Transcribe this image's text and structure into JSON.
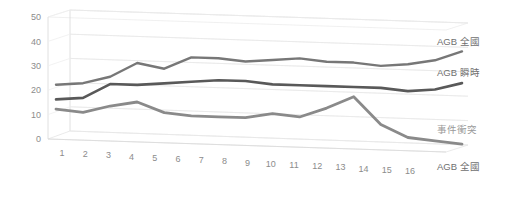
{
  "chart": {
    "type": "line",
    "style": "3d-perspective",
    "title": "",
    "background": "#ffffff"
  },
  "axes": {
    "y": {
      "ticks": [
        "0",
        "10",
        "20",
        "30",
        "40",
        "50"
      ],
      "min": 0,
      "max": 50,
      "label": ""
    },
    "x": {
      "ticks": [
        "1",
        "2",
        "3",
        "4",
        "5",
        "6",
        "7",
        "8",
        "9",
        "10",
        "11",
        "12",
        "13",
        "14",
        "15",
        "16"
      ],
      "label": ""
    },
    "depth": {
      "label": "AGB 全國"
    }
  },
  "legend": {
    "position": "right",
    "items": [
      {
        "label": "AGB 全國",
        "color": "#777777"
      },
      {
        "label": "AGB 瞬時",
        "color": "#595959"
      },
      {
        "label": "事件衝突",
        "color": "#8a8a8a"
      },
      {
        "label": "AGB 全國",
        "color": "#b8b8b8"
      }
    ]
  },
  "chart_data": {
    "type": "line",
    "title": "",
    "xlabel": "",
    "ylabel": "",
    "ylim": [
      0,
      50
    ],
    "grid": true,
    "legend_position": "right",
    "categories": [
      "1",
      "2",
      "3",
      "4",
      "5",
      "6",
      "7",
      "8",
      "9",
      "10",
      "11",
      "12",
      "13",
      "14",
      "15",
      "16"
    ],
    "series": [
      {
        "name": "AGB 全國",
        "color": "#777777",
        "values": [
          21,
          22,
          25,
          31,
          29,
          34,
          34,
          33,
          34,
          35,
          34,
          34,
          33,
          34,
          36,
          40
        ]
      },
      {
        "name": "AGB 瞬時",
        "color": "#595959",
        "values": [
          15,
          16,
          22,
          22,
          23,
          24,
          25,
          25,
          24,
          24,
          24,
          24,
          24,
          23,
          24,
          27
        ]
      },
      {
        "name": "事件衝突",
        "color": "#8a8a8a",
        "values": [
          11,
          10,
          13,
          15,
          11,
          10,
          10,
          10,
          12,
          11,
          15,
          20,
          9,
          4,
          3,
          2
        ]
      }
    ]
  },
  "colors": {
    "grid": "#e9e9e9",
    "tick_text": "#8c8c8c",
    "legend_text": "#6f6f6f",
    "panel": "#ffffff"
  }
}
